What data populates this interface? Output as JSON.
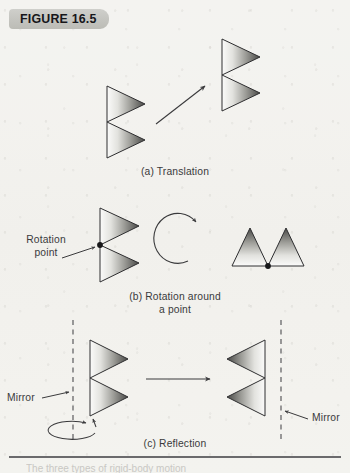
{
  "figure": {
    "badge_label": "FIGURE 16.5",
    "background_color": "#f3f3f0",
    "badge_color": "#c4c4bf",
    "ink_color": "#3a3a3c"
  },
  "panels": [
    {
      "id": "translation",
      "caption": "(a) Translation",
      "operation": "translation",
      "source_shape": "double-right-triangle",
      "result_shape": "double-right-triangle",
      "arrow": "straight-diagonal-up-right"
    },
    {
      "id": "rotation",
      "caption_line1": "(b) Rotation around",
      "caption_line2": "a point",
      "operation": "rotation",
      "source_shape": "double-right-triangle",
      "result_shape": "double-up-triangle",
      "arrow": "curved-counterclockwise",
      "annotations": [
        {
          "name": "rotation-point",
          "line1": "Rotation",
          "line2": "point"
        }
      ]
    },
    {
      "id": "reflection",
      "caption": "(c) Reflection",
      "operation": "reflection",
      "source_shape": "double-right-triangle",
      "result_shape": "double-left-triangle",
      "arrow": "straight-right",
      "annotations": [
        {
          "name": "mirror-left",
          "label": "Mirror"
        },
        {
          "name": "mirror-right",
          "label": "Mirror"
        }
      ],
      "flip_arrow": "ellipse-flip"
    }
  ],
  "footer": {
    "cut_text": "The three types of rigid-body motion"
  }
}
